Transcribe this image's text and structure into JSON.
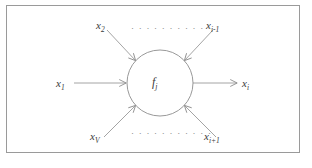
{
  "figure": {
    "type": "neuron-node-diagram",
    "background_color": "#ffffff",
    "frame_color": "#9a9a9a",
    "stroke_color": "#8d8d8d",
    "text_color": "#3a3a3a",
    "node": {
      "label_base": "f",
      "label_sub": "j",
      "center_x": 160,
      "center_y": 83,
      "radius": 33
    },
    "inputs": [
      {
        "name": "input-x1",
        "base": "x",
        "sub": "1",
        "label_x": 56,
        "label_y": 78,
        "direction": "horizontal-left"
      },
      {
        "name": "input-x2",
        "base": "x",
        "sub": "2",
        "label_x": 96,
        "label_y": 20,
        "direction": "diagonal-top-left"
      },
      {
        "name": "input-xi-minus-1",
        "base": "x",
        "sub": "i-1",
        "label_x": 206,
        "label_y": 20,
        "direction": "diagonal-top-right"
      },
      {
        "name": "input-xV",
        "base": "x",
        "sub": "V",
        "label_x": 90,
        "label_y": 131,
        "direction": "diagonal-bottom-left"
      },
      {
        "name": "input-xi-plus-1",
        "base": "x",
        "sub": "i+1",
        "label_x": 204,
        "label_y": 131,
        "direction": "diagonal-bottom-right"
      }
    ],
    "output": {
      "name": "output-xi",
      "base": "x",
      "sub": "i",
      "label_x": 242,
      "label_y": 78,
      "direction": "horizontal-right"
    },
    "ellipses": [
      {
        "name": "ellipsis-top",
        "text": "· · · · · · · · · · ·",
        "x": 131,
        "y": 24
      },
      {
        "name": "ellipsis-bottom",
        "text": "· · · · · · · · · · ·",
        "x": 131,
        "y": 129
      }
    ]
  }
}
